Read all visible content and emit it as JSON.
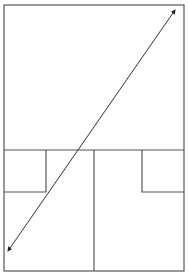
{
  "diagram": {
    "type": "floor-plan-with-diagonal-arrow",
    "stroke_color": "#555555",
    "arrow_color": "#333333",
    "outer_frame": {
      "x": 4,
      "y": 5,
      "width": 180,
      "height": 266
    },
    "horizontal_divider": {
      "x1": 4,
      "y1": 150,
      "x2": 184,
      "y2": 150
    },
    "center_vertical": {
      "x1": 94,
      "y1": 150,
      "x2": 94,
      "y2": 271
    },
    "left_small_box": {
      "x1": 4,
      "y1": 150,
      "x2": 46,
      "y2": 192
    },
    "right_small_box": {
      "x1": 142,
      "y1": 150,
      "x2": 184,
      "y2": 192
    },
    "arrow": {
      "x1": 8,
      "y1": 251,
      "x2": 175,
      "y2": 10,
      "double_headed": true
    }
  }
}
